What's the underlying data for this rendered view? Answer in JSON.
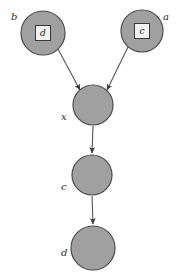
{
  "diagram": {
    "background_color": "#ffffff",
    "node_fill_color": "#a0a0a0",
    "node_stroke_color": "#4a4a4a",
    "inner_square_fill": "#f2f2f2",
    "inner_square_stroke": "#3a3a3a",
    "edge_color": "#555555",
    "label_color": "#2b2b2b",
    "nodes": [
      {
        "id": "node-b",
        "label": "b",
        "label_x": 11,
        "label_y": 20,
        "cx": 43,
        "cy": 33,
        "r": 22,
        "inner_square": true,
        "inner_label": "d",
        "square_size": 15
      },
      {
        "id": "node-a",
        "label": "a",
        "label_x": 163,
        "label_y": 20,
        "cx": 142,
        "cy": 31,
        "r": 21,
        "inner_square": true,
        "inner_label": "c",
        "square_size": 15
      },
      {
        "id": "node-x",
        "label": "x",
        "label_x": 61,
        "label_y": 120,
        "cx": 93,
        "cy": 105,
        "r": 20,
        "inner_square": false,
        "inner_label": "",
        "square_size": 0
      },
      {
        "id": "node-c",
        "label": "c",
        "label_x": 61,
        "label_y": 190,
        "cx": 92,
        "cy": 175,
        "r": 20,
        "inner_square": false,
        "inner_label": "",
        "square_size": 0
      },
      {
        "id": "node-d",
        "label": "d",
        "label_x": 61,
        "label_y": 256,
        "cx": 93,
        "cy": 248,
        "r": 22,
        "inner_square": false,
        "inner_label": "",
        "square_size": 0
      }
    ],
    "edges": [
      {
        "id": "edge-b-x",
        "from": "b",
        "to": "x",
        "x1": 58,
        "y1": 49,
        "x2": 80,
        "y2": 90
      },
      {
        "id": "edge-a-x",
        "from": "a",
        "to": "x",
        "x1": 128,
        "y1": 47,
        "x2": 107,
        "y2": 90
      },
      {
        "id": "edge-x-c",
        "from": "x",
        "to": "c",
        "x1": 93,
        "y1": 126,
        "x2": 92,
        "y2": 153
      },
      {
        "id": "edge-c-d",
        "from": "c",
        "to": "d",
        "x1": 92,
        "y1": 196,
        "x2": 93,
        "y2": 224
      }
    ]
  }
}
